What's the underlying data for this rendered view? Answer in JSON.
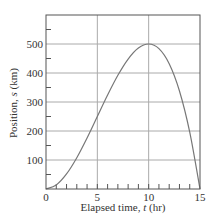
{
  "chart_data": {
    "type": "line",
    "title": "",
    "xlabel": "Elapsed time, t (hr)",
    "xlabel_parts": {
      "before": "Elapsed time, ",
      "var": "t",
      "after": " (hr)"
    },
    "ylabel": "Position, s (km)",
    "ylabel_parts": {
      "before": "Position, ",
      "var": "s",
      "after": " (km)"
    },
    "xlim": [
      0,
      15
    ],
    "ylim": [
      0,
      600
    ],
    "x_ticks": [
      0,
      5,
      10,
      15
    ],
    "x_tick_labels": [
      "0",
      "5",
      "10",
      "15"
    ],
    "x_minor_step": 1,
    "y_ticks": [
      100,
      200,
      300,
      400,
      500
    ],
    "y_tick_labels": [
      "100",
      "200",
      "300",
      "400",
      "500"
    ],
    "y_minor_step": 50,
    "grid": true,
    "legend": null,
    "series": [
      {
        "name": "s(t)",
        "x": [
          0,
          1,
          2,
          3,
          4,
          5,
          6,
          7,
          8,
          9,
          10,
          11,
          12,
          13,
          14,
          15
        ],
        "values": [
          0,
          14,
          52,
          108,
          176,
          250,
          324,
          392,
          448,
          486,
          500,
          484,
          432,
          338,
          196,
          0
        ]
      }
    ],
    "colors": {
      "curve": "#777777",
      "grid": "#aaaaaa",
      "axis": "#555555",
      "text": "#333333"
    }
  }
}
